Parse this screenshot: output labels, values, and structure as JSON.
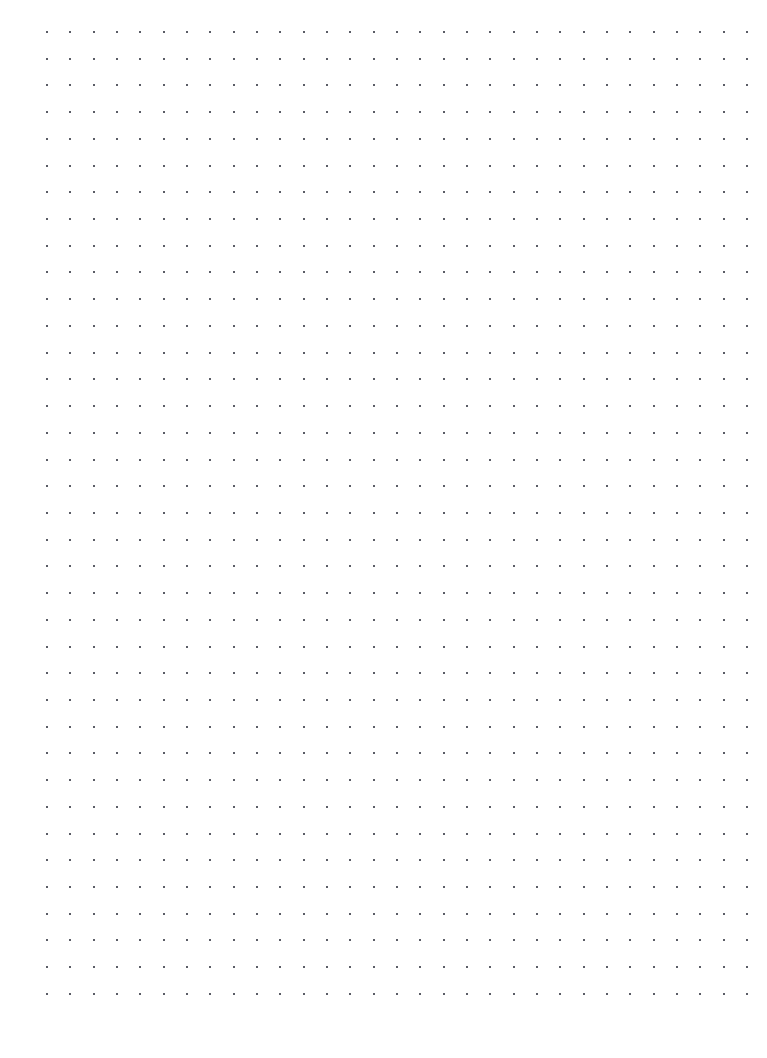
{
  "page": {
    "type": "blank-dot-grid-sheet",
    "width_px": 767,
    "height_px": 1058,
    "background_color": "#ffffff",
    "content_text": ""
  },
  "dot_grid": {
    "name": "dot-grid",
    "columns": 31,
    "rows": 37,
    "origin_x_px": 47,
    "origin_y_px": 32,
    "spacing_x_px": 23.33,
    "spacing_y_px": 26.72,
    "dot_size_px": 2,
    "dot_color": "#5a5c66",
    "margin_left_px": 47,
    "margin_top_px": 32,
    "margin_right_px": 20,
    "margin_bottom_px": 64
  }
}
